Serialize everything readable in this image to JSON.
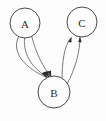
{
  "figure": {
    "title": "",
    "background_color": "#fdfdfd",
    "width": 106,
    "height": 121
  },
  "graph": {
    "type": "directed-multigraph",
    "node_stroke_color": "#4a4a4a",
    "node_fill_color": "#fdfdfd",
    "edge_color": "#6a6a6a",
    "arrow_color": "#2b2b2b",
    "label_color": "#2b2b2b",
    "nodes": [
      {
        "id": "A",
        "label": "A",
        "cx": 25,
        "cy": 23,
        "r": 15
      },
      {
        "id": "C",
        "label": "C",
        "cx": 82,
        "cy": 22,
        "r": 15
      },
      {
        "id": "B",
        "label": "B",
        "cx": 54,
        "cy": 92,
        "r": 16
      }
    ],
    "edges": [
      {
        "from": "A",
        "to": "B",
        "index": 1,
        "directed": true,
        "curve": "left"
      },
      {
        "from": "A",
        "to": "B",
        "index": 2,
        "directed": true,
        "curve": "middle"
      },
      {
        "from": "A",
        "to": "B",
        "index": 3,
        "directed": true,
        "curve": "right"
      },
      {
        "from": "B",
        "to": "C",
        "index": 1,
        "directed": true,
        "curve": "left"
      },
      {
        "from": "B",
        "to": "C",
        "index": 2,
        "directed": true,
        "curve": "right"
      }
    ],
    "edge_counts": {
      "A_to_B": 3,
      "B_to_C": 2
    }
  }
}
